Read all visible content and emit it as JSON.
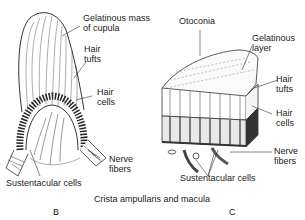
{
  "figure": {
    "caption": "Crista ampullaris and macula",
    "panels": [
      {
        "letter": "B",
        "name": "crista-ampullaris",
        "labels": {
          "cupula": [
            "Gelatinous mass",
            "of cupula"
          ],
          "hair_tufts": [
            "Hair",
            "tufts"
          ],
          "hair_cells": [
            "Hair",
            "cells"
          ],
          "nerve_fibers": [
            "Nerve",
            "fibers"
          ],
          "sustentacular": "Sustentacular cells"
        }
      },
      {
        "letter": "C",
        "name": "macula",
        "labels": {
          "otoconia": "Otoconia",
          "gelatinous_layer": [
            "Gelatinous",
            "layer"
          ],
          "hair_tufts": [
            "Hair",
            "tufts"
          ],
          "hair_cells": [
            "Hair",
            "cells"
          ],
          "nerve_fibers": [
            "Nerve",
            "fibers"
          ],
          "sustentacular": "Sustentacular cells"
        }
      }
    ]
  }
}
